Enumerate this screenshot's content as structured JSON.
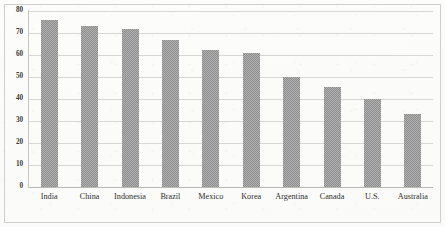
{
  "chart_data": {
    "type": "bar",
    "title": "",
    "subtitle": "",
    "xlabel": "",
    "ylabel": "",
    "categories": [
      "India",
      "China",
      "Indonesia",
      "Brazil",
      "Mexico",
      "Korea",
      "Argentina",
      "Canada",
      "U.S.",
      "Australia"
    ],
    "values": [
      76,
      73,
      72,
      67,
      62.5,
      61,
      50,
      45.5,
      40,
      33
    ],
    "ylim": [
      0,
      80
    ],
    "ytick_labels": [
      "0",
      "10",
      "20",
      "30",
      "40",
      "50",
      "60",
      "70",
      "80"
    ],
    "ytick_values": [
      0,
      10,
      20,
      30,
      40,
      50,
      60,
      70,
      80
    ],
    "grid": true,
    "grid_axis": "y",
    "legend": false,
    "legend_position": "none",
    "series": [
      {
        "name": "",
        "values": [
          76,
          73,
          72,
          67,
          62.5,
          61,
          50,
          45.5,
          40,
          33
        ]
      }
    ],
    "annotations": [],
    "bar_color": "#8e8e8e",
    "grid_color": "#d7d7d3",
    "axis_color": "#b9b9b4",
    "background_color": "#fbfbfa"
  }
}
